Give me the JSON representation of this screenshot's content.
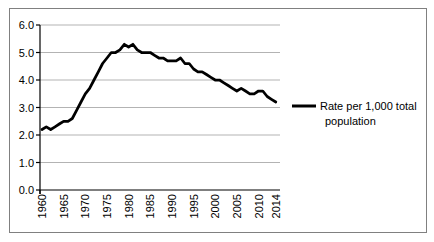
{
  "figure": {
    "background": "#ffffff",
    "border_color": "#808080"
  },
  "chart_data": {
    "type": "line",
    "title": "",
    "xlabel": "",
    "ylabel": "",
    "x": [
      1960,
      1961,
      1962,
      1963,
      1964,
      1965,
      1966,
      1967,
      1968,
      1969,
      1970,
      1971,
      1972,
      1973,
      1974,
      1975,
      1976,
      1977,
      1978,
      1979,
      1980,
      1981,
      1982,
      1983,
      1984,
      1985,
      1986,
      1987,
      1988,
      1989,
      1990,
      1991,
      1992,
      1993,
      1994,
      1995,
      1996,
      1997,
      1998,
      1999,
      2000,
      2001,
      2002,
      2003,
      2004,
      2005,
      2006,
      2007,
      2008,
      2009,
      2010,
      2011,
      2012,
      2013,
      2014
    ],
    "series": [
      {
        "name": "Rate per 1,000 total population",
        "color": "#000000",
        "values": [
          2.2,
          2.3,
          2.2,
          2.3,
          2.4,
          2.5,
          2.5,
          2.6,
          2.9,
          3.2,
          3.5,
          3.7,
          4.0,
          4.3,
          4.6,
          4.8,
          5.0,
          5.0,
          5.1,
          5.3,
          5.2,
          5.3,
          5.1,
          5.0,
          5.0,
          5.0,
          4.9,
          4.8,
          4.8,
          4.7,
          4.7,
          4.7,
          4.8,
          4.6,
          4.6,
          4.4,
          4.3,
          4.3,
          4.2,
          4.1,
          4.0,
          4.0,
          3.9,
          3.8,
          3.7,
          3.6,
          3.7,
          3.6,
          3.5,
          3.5,
          3.6,
          3.6,
          3.4,
          3.3,
          3.2
        ]
      }
    ],
    "ylim": [
      0.0,
      6.0
    ],
    "ytick_labels": [
      "0.0",
      "1.0",
      "2.0",
      "3.0",
      "4.0",
      "5.0",
      "6.0"
    ],
    "xtick_labels": [
      "1960",
      "1965",
      "1970",
      "1975",
      "1980",
      "1985",
      "1990",
      "1995",
      "2000",
      "2005",
      "2010",
      "2014"
    ],
    "grid": "horizontal",
    "gridline_color": "#b3b3b3",
    "axis_color": "#000000",
    "legend_position": "right",
    "legend": {
      "lines": [
        "Rate per 1,000 total",
        "population"
      ]
    }
  }
}
